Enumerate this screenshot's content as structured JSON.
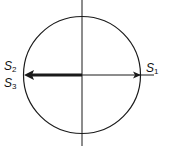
{
  "diagram": {
    "type": "phasor-circle",
    "labels": {
      "s1": {
        "base": "S",
        "sub": "1"
      },
      "s2": {
        "base": "S",
        "sub": "2"
      },
      "s3": {
        "base": "S",
        "sub": "3"
      }
    },
    "colors": {
      "line": "#1a1a1a",
      "background": "#ffffff"
    }
  }
}
